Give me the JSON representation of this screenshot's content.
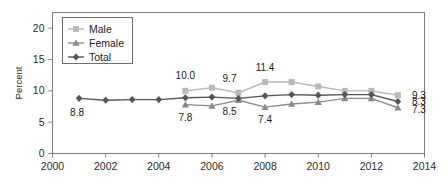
{
  "chart_data": {
    "type": "line",
    "title": "",
    "subtitle": "",
    "xlabel": "",
    "ylabel": "Percent",
    "xlim": [
      2000,
      2014
    ],
    "ylim": [
      0,
      22.5
    ],
    "yticks": [
      0,
      5,
      10,
      15,
      20
    ],
    "ytick_labels": [
      "0",
      "5",
      "10",
      "15",
      "20"
    ],
    "xticks": [
      2000,
      2002,
      2004,
      2006,
      2008,
      2010,
      2012,
      2014
    ],
    "xtick_labels": [
      "2000",
      "2002",
      "2004",
      "2006",
      "2008",
      "2010",
      "2012",
      "2014"
    ],
    "grid": false,
    "legend_position": "top-left",
    "x": [
      2001,
      2002,
      2003,
      2004,
      2005,
      2006,
      2007,
      2008,
      2009,
      2010,
      2011,
      2012,
      2013
    ],
    "series": [
      {
        "name": "Male",
        "color": "#b9b9b9",
        "marker": "square",
        "values": [
          null,
          null,
          null,
          null,
          10.0,
          10.5,
          9.7,
          11.4,
          11.4,
          10.7,
          10.0,
          10.0,
          9.3
        ]
      },
      {
        "name": "Female",
        "color": "#8a8a8a",
        "marker": "triangle",
        "values": [
          null,
          null,
          null,
          null,
          7.8,
          7.6,
          8.5,
          7.4,
          7.9,
          8.2,
          8.8,
          8.8,
          7.3
        ]
      },
      {
        "name": "Total",
        "color": "#555555",
        "marker": "diamond",
        "values": [
          8.8,
          8.5,
          8.6,
          8.6,
          8.9,
          9.0,
          8.8,
          9.2,
          9.4,
          9.3,
          9.4,
          9.4,
          8.3
        ]
      }
    ],
    "annotations": [
      {
        "text": "8.8",
        "x": 2001,
        "y": 8.8,
        "dx": -2,
        "dy": 18,
        "series": "Total"
      },
      {
        "text": "10.0",
        "x": 2005,
        "y": 10.0,
        "dx": 0,
        "dy": -12,
        "series": "Male"
      },
      {
        "text": "7.8",
        "x": 2005,
        "y": 7.8,
        "dx": 0,
        "dy": 16,
        "series": "Female"
      },
      {
        "text": "9.7",
        "x": 2007,
        "y": 9.7,
        "dx": -9,
        "dy": -11,
        "series": "Male"
      },
      {
        "text": "8.5",
        "x": 2007,
        "y": 8.5,
        "dx": -9,
        "dy": 15,
        "series": "Female"
      },
      {
        "text": "11.4",
        "x": 2008,
        "y": 11.4,
        "dx": 0,
        "dy": -11,
        "series": "Male"
      },
      {
        "text": "7.4",
        "x": 2008,
        "y": 7.4,
        "dx": 0,
        "dy": 16,
        "series": "Female"
      },
      {
        "text": "9.3",
        "x": 2013,
        "y": 9.3,
        "dx": 14,
        "dy": 4,
        "series": "Male"
      },
      {
        "text": "8.3",
        "x": 2013,
        "y": 8.3,
        "dx": 14,
        "dy": 4,
        "series": "Total"
      },
      {
        "text": "7.3",
        "x": 2013,
        "y": 7.3,
        "dx": 14,
        "dy": 5,
        "series": "Female"
      }
    ]
  },
  "legend": {
    "entries": [
      {
        "label": "Male"
      },
      {
        "label": "Female"
      },
      {
        "label": "Total"
      }
    ]
  },
  "axes": {
    "y_title": "Percent"
  }
}
